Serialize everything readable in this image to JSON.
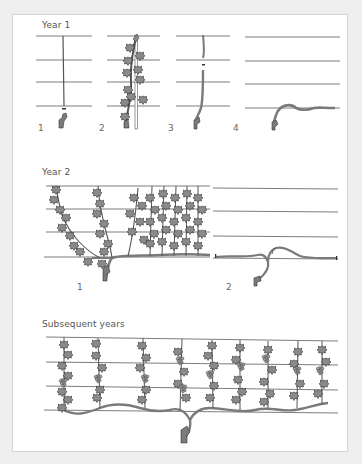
{
  "figure": {
    "colors": {
      "background": "#efefef",
      "panel": "#ffffff",
      "panel_border": "#d4d4d4",
      "wire": "#6e6e6e",
      "vine": "#8a8a8a",
      "vine_outline": "#3c3c3c",
      "label_text": "#555555"
    },
    "sections": [
      {
        "title": "Year 1",
        "steps": [
          {
            "label": "1",
            "description": "single upright cane tied to stake after planting, cut back"
          },
          {
            "label": "2",
            "description": "cane grows up the stake with leaves"
          },
          {
            "label": "3",
            "description": "cane cut back near lowest wire"
          },
          {
            "label": "4",
            "description": "cane bent along bottom wire"
          }
        ]
      },
      {
        "title": "Year 2",
        "steps": [
          {
            "label": "1",
            "description": "arm along bottom wire with vertical shoots"
          },
          {
            "label": "2",
            "description": "pruned arms tied along bottom wire"
          }
        ]
      },
      {
        "title": "Subsequent years",
        "steps": [
          {
            "label": "",
            "description": "mature espalier with two arms and nine vertical fruiting shoots"
          }
        ]
      }
    ],
    "wires_per_trellis": 4
  }
}
